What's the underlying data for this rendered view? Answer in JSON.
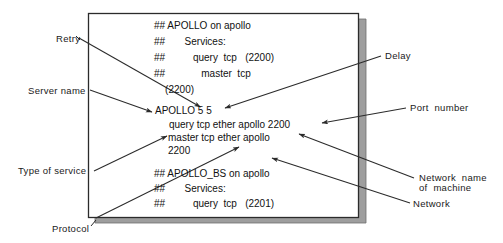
{
  "figure": {
    "kind": "annotated-terminal-config-diagram",
    "colors": {
      "background": "#ffffff",
      "text": "#1a1a1a",
      "box_border": "#2b2b2b",
      "box_fill": "#ffffff",
      "shadow": "#9a9a9a",
      "leader_line": "#2b2b2b"
    }
  },
  "window": {
    "name": "config-listing-window",
    "content": {
      "block_top": [
        "## APOLLO on apollo",
        "##       Services:",
        "##          query  tcp   (2200)",
        "##             master  tcp",
        "    (2200)"
      ],
      "block_middle": [
        "APOLLO 5 5",
        "     query tcp ether apollo 2200",
        "master tcp ether apollo",
        "2200"
      ],
      "block_bottom": [
        "## APOLLO_BS on apollo",
        "##       Services:",
        "##          query  tcp   (2201)"
      ]
    }
  },
  "annotations": {
    "left": [
      {
        "id": "retry",
        "label": "Retry"
      },
      {
        "id": "server-name",
        "label": "Server name"
      },
      {
        "id": "type-of-service",
        "label": "Type of service"
      },
      {
        "id": "protocol",
        "label": "Protocol"
      }
    ],
    "right": [
      {
        "id": "delay",
        "label": "Delay"
      },
      {
        "id": "port-number",
        "label": "Port  number"
      },
      {
        "id": "network-name-of-machine",
        "label_line1": "Network  name",
        "label_line2": "of  machine"
      },
      {
        "id": "network",
        "label": "Network"
      }
    ]
  }
}
